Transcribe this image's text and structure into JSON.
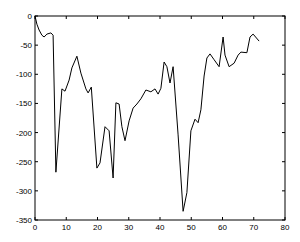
{
  "chart_data": {
    "type": "line",
    "title": "",
    "xlabel": "",
    "ylabel": "",
    "xlim": [
      0,
      80
    ],
    "ylim": [
      -350,
      0
    ],
    "grid": false,
    "legend": null,
    "x_ticks": [
      0,
      10,
      20,
      30,
      40,
      50,
      60,
      70,
      80
    ],
    "y_ticks": [
      0,
      -50,
      -100,
      -150,
      -200,
      -250,
      -300,
      -350
    ],
    "series": [
      {
        "name": "series-1",
        "color": "#000000",
        "x": [
          0,
          0.6,
          1.3,
          2.2,
          2.9,
          3.8,
          5.1,
          5.8,
          6.7,
          8.6,
          9.6,
          10.9,
          11.8,
          13.4,
          14.7,
          16.3,
          17.0,
          18.0,
          19.8,
          20.8,
          22.4,
          23.7,
          25.0,
          25.9,
          26.9,
          27.8,
          28.8,
          30.1,
          31.4,
          32.6,
          33.9,
          35.5,
          37.1,
          38.4,
          39.4,
          40.3,
          41.3,
          42.2,
          43.2,
          44.2,
          45.8,
          47.4,
          48.6,
          49.9,
          51.2,
          52.2,
          53.1,
          54.1,
          55.0,
          56.0,
          57.3,
          58.9,
          60.2,
          60.8,
          62.1,
          63.7,
          65.0,
          65.9,
          67.8,
          68.8,
          69.8,
          71.7
        ],
        "y": [
          0,
          -14,
          -24,
          -33,
          -36,
          -31,
          -29,
          -33,
          -268,
          -125,
          -129,
          -110,
          -89,
          -69,
          -98,
          -125,
          -132,
          -122,
          -261,
          -252,
          -190,
          -197,
          -278,
          -149,
          -151,
          -190,
          -214,
          -180,
          -158,
          -151,
          -142,
          -127,
          -130,
          -125,
          -134,
          -124,
          -79,
          -87,
          -115,
          -87,
          -204,
          -335,
          -303,
          -197,
          -177,
          -183,
          -161,
          -103,
          -72,
          -65,
          -75,
          -87,
          -36,
          -67,
          -87,
          -81,
          -67,
          -62,
          -63,
          -36,
          -31,
          -43
        ]
      }
    ]
  }
}
